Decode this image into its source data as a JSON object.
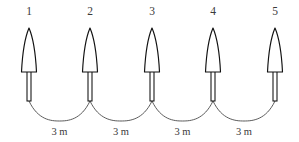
{
  "diagram": {
    "background_color": "#ffffff",
    "line_color": "#111111",
    "rope_color": "#4a4a4a",
    "text_color": "#3a3a3a",
    "pins": [
      {
        "label": "1",
        "cx": 29,
        "number_y": 15
      },
      {
        "label": "2",
        "cx": 90,
        "number_y": 15
      },
      {
        "label": "3",
        "cx": 152,
        "number_y": 15
      },
      {
        "label": "4",
        "cx": 213,
        "number_y": 15
      },
      {
        "label": "5",
        "cx": 275,
        "number_y": 15
      }
    ],
    "spans": [
      {
        "label": "3 m",
        "from": "1",
        "to": "2",
        "cx": 59.5,
        "label_y": 131
      },
      {
        "label": "3 m",
        "from": "2",
        "to": "3",
        "cx": 121,
        "label_y": 131
      },
      {
        "label": "3 m",
        "from": "3",
        "to": "4",
        "cx": 182.5,
        "label_y": 131
      },
      {
        "label": "3 m",
        "from": "4",
        "to": "5",
        "cx": 244,
        "label_y": 131
      }
    ],
    "geometry": {
      "cone_tip_y": 28,
      "cone_base_y": 72,
      "cone_half_width": 7.5,
      "stem_half_width": 2,
      "stem_bottom_y": 101,
      "arc_sag": 16
    }
  }
}
